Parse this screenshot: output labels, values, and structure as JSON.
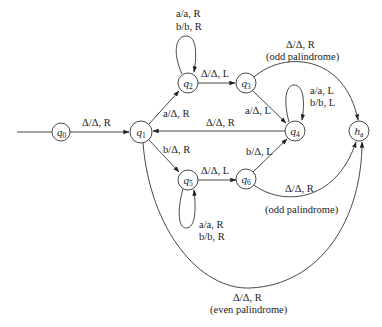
{
  "diagram": {
    "type": "turing-machine-state-diagram",
    "colors": {
      "stroke": "#333333",
      "text": "#222222",
      "background": "#ffffff"
    },
    "states": [
      {
        "id": "q0",
        "name": "q",
        "sub": "0",
        "x": 61,
        "y": 132,
        "start": true
      },
      {
        "id": "q1",
        "name": "q",
        "sub": "1",
        "x": 141,
        "y": 132
      },
      {
        "id": "q2",
        "name": "q",
        "sub": "2",
        "x": 188,
        "y": 83
      },
      {
        "id": "q3",
        "name": "q",
        "sub": "3",
        "x": 246,
        "y": 83
      },
      {
        "id": "q4",
        "name": "q",
        "sub": "4",
        "x": 295,
        "y": 131
      },
      {
        "id": "q5",
        "name": "q",
        "sub": "5",
        "x": 188,
        "y": 180
      },
      {
        "id": "q6",
        "name": "q",
        "sub": "6",
        "x": 246,
        "y": 179
      },
      {
        "id": "ha",
        "name": "h",
        "sub": "a",
        "x": 359,
        "y": 131,
        "accepting": true
      }
    ],
    "transitions": [
      {
        "from": "q0",
        "to": "q1",
        "label": "Δ/Δ, R"
      },
      {
        "from": "q1",
        "to": "q2",
        "label": "a/Δ, R"
      },
      {
        "from": "q1",
        "to": "q5",
        "label": "b/Δ, R"
      },
      {
        "from": "q2",
        "to": "q2",
        "label_lines": [
          "a/a, R",
          "b/b, R"
        ]
      },
      {
        "from": "q2",
        "to": "q3",
        "label": "Δ/Δ, L"
      },
      {
        "from": "q3",
        "to": "q4",
        "label": "a/Δ, L"
      },
      {
        "from": "q3",
        "to": "ha",
        "label_lines": [
          "Δ/Δ, R",
          "(odd palindrome)"
        ]
      },
      {
        "from": "q4",
        "to": "q4",
        "label_lines": [
          "a/a, L",
          "b/b, L"
        ]
      },
      {
        "from": "q4",
        "to": "q1",
        "label": "Δ/Δ, R"
      },
      {
        "from": "q5",
        "to": "q5",
        "label_lines": [
          "a/a, R",
          "b/b, R"
        ]
      },
      {
        "from": "q5",
        "to": "q6",
        "label": "Δ/Δ, L"
      },
      {
        "from": "q6",
        "to": "q4",
        "label": "b/Δ, L"
      },
      {
        "from": "q6",
        "to": "ha",
        "label_lines": [
          "Δ/Δ, R",
          "(odd palindrome)"
        ]
      },
      {
        "from": "q1",
        "to": "ha",
        "label_lines": [
          "Δ/Δ, R",
          "(even palindrome)"
        ]
      }
    ],
    "labels": {
      "q0_q1": "Δ/Δ, R",
      "q1_q2": "a/Δ, R",
      "q1_q5": "b/Δ, R",
      "q2_loop_1": "a/a, R",
      "q2_loop_2": "b/b, R",
      "q2_q3": "Δ/Δ, L",
      "q3_q4": "a/Δ, L",
      "q3_ha_1": "Δ/Δ, R",
      "q3_ha_2": "(odd palindrome)",
      "q4_loop_1": "a/a, L",
      "q4_loop_2": "b/b, L",
      "q4_q1": "Δ/Δ, R",
      "q5_loop_1": "a/a, R",
      "q5_loop_2": "b/b, R",
      "q5_q6": "Δ/Δ, L",
      "q6_q4": "b/Δ, L",
      "q6_ha_1": "Δ/Δ, R",
      "q6_ha_2": "(odd palindrome)",
      "q1_ha_1": "Δ/Δ, R",
      "q1_ha_2": "(even palindrome)"
    },
    "state_labels": {
      "q0": {
        "base": "q",
        "sub": "0"
      },
      "q1": {
        "base": "q",
        "sub": "1"
      },
      "q2": {
        "base": "q",
        "sub": "2"
      },
      "q3": {
        "base": "q",
        "sub": "3"
      },
      "q4": {
        "base": "q",
        "sub": "4"
      },
      "q5": {
        "base": "q",
        "sub": "5"
      },
      "q6": {
        "base": "q",
        "sub": "6"
      },
      "ha": {
        "base": "h",
        "sub": "a"
      }
    }
  }
}
